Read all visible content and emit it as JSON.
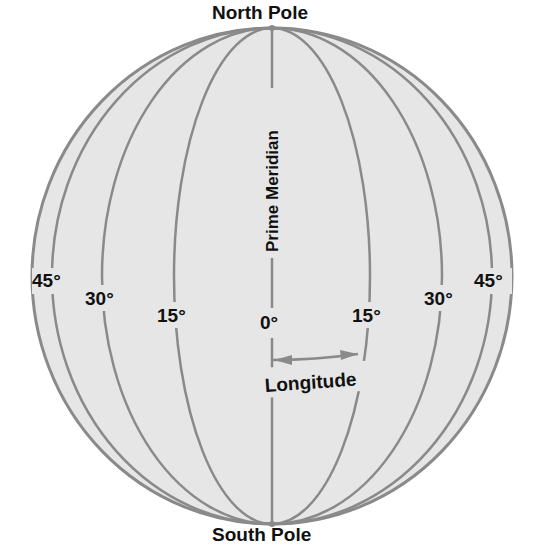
{
  "diagram": {
    "poles": {
      "north": "North Pole",
      "south": "South Pole"
    },
    "prime_meridian_label": "Prime Meridian",
    "longitude_label": "Longitude",
    "degree_labels": {
      "left_45": "45°",
      "left_30": "30°",
      "left_15": "15°",
      "center_0": "0°",
      "right_15": "15°",
      "right_30": "30°",
      "right_45": "45°"
    },
    "colors": {
      "globe_fill": "#e6e6e6",
      "line": "#8a8a8a",
      "text": "#111111",
      "background": "#ffffff"
    },
    "geometry": {
      "center_x": 272,
      "center_y": 276,
      "radius_x": 240,
      "radius_y": 248,
      "meridian_half_widths": [
        98,
        170,
        220
      ]
    }
  }
}
